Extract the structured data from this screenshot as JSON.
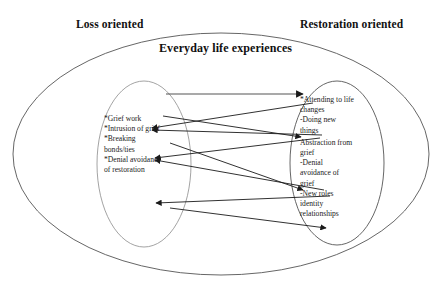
{
  "diagram": {
    "type": "dual-process-model-venn",
    "headers": {
      "left": "Loss oriented",
      "right": "Restoration oriented"
    },
    "outer_ellipse_label": "Everyday life experiences",
    "left_cluster": {
      "name": "loss-oriented-cluster",
      "items": [
        "*Grief work",
        "*Intrusion of grief",
        "*Breaking",
        "bonds/ties",
        "*Denial avoidance",
        "of restoration"
      ]
    },
    "right_cluster": {
      "name": "restoration-oriented-cluster",
      "items": [
        "*Attending to life",
        " changes",
        "-Doing new",
        "things",
        "Abstraction from",
        "grief",
        "-Denial",
        "avoidance of",
        "grief",
        "-New  roles",
        "identity",
        "relationships"
      ]
    },
    "connectors": [
      {
        "name": "connector-top-right",
        "direction": "to-right"
      },
      {
        "name": "connector-upper-left",
        "direction": "to-left"
      },
      {
        "name": "connector-upper-left-2",
        "direction": "to-left"
      },
      {
        "name": "connector-mid-right",
        "direction": "to-right"
      },
      {
        "name": "connector-mid-left",
        "direction": "to-left"
      },
      {
        "name": "connector-mid-left-2",
        "direction": "to-left"
      },
      {
        "name": "connector-lower-right",
        "direction": "to-right"
      },
      {
        "name": "connector-lower-left",
        "direction": "to-left"
      },
      {
        "name": "connector-bottom-right",
        "direction": "to-right"
      }
    ],
    "colors": {
      "stroke": "#555555",
      "arrow": "#1a1a1a",
      "text": "#111111",
      "background": "#ffffff"
    }
  }
}
